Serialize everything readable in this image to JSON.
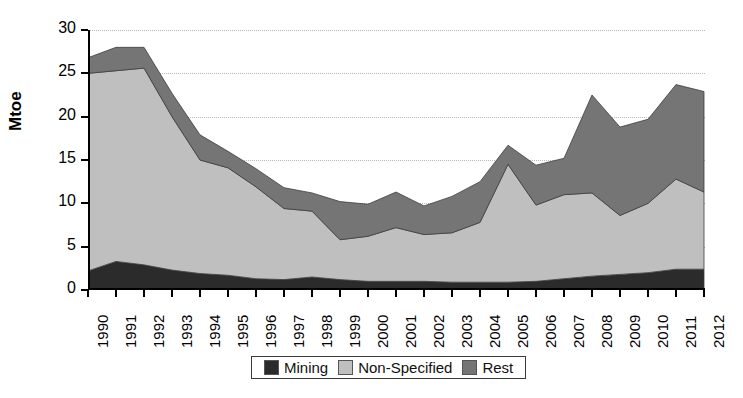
{
  "chart_data": {
    "type": "area",
    "stacked": true,
    "title": "",
    "xlabel": "",
    "ylabel": "Mtoe",
    "ylim": [
      0,
      30
    ],
    "yticks": [
      0,
      5,
      10,
      15,
      20,
      25,
      30
    ],
    "grid": true,
    "legend_position": "bottom",
    "categories": [
      "1990",
      "1991",
      "1992",
      "1993",
      "1994",
      "1995",
      "1996",
      "1997",
      "1998",
      "1999",
      "2000",
      "2001",
      "2002",
      "2003",
      "2004",
      "2005",
      "2006",
      "2007",
      "2008",
      "2009",
      "2010",
      "2011",
      "2012"
    ],
    "series": [
      {
        "name": "Mining",
        "color": "#2b2b2b",
        "values": [
          2.2,
          3.3,
          2.9,
          2.3,
          1.9,
          1.7,
          1.3,
          1.2,
          1.5,
          1.2,
          1.0,
          1.0,
          1.0,
          0.9,
          0.9,
          0.9,
          1.0,
          1.3,
          1.6,
          1.8,
          2.0,
          2.4,
          2.4
        ]
      },
      {
        "name": "Non-Specified",
        "color": "#bfbfbf",
        "values": [
          22.8,
          22.0,
          22.7,
          17.7,
          13.1,
          12.4,
          10.6,
          8.2,
          7.6,
          4.6,
          5.2,
          6.2,
          5.4,
          5.7,
          6.9,
          13.6,
          8.8,
          9.7,
          9.6,
          6.8,
          8.0,
          10.4,
          8.9
        ]
      },
      {
        "name": "Rest",
        "color": "#757575",
        "values": [
          1.8,
          2.7,
          2.4,
          2.7,
          2.9,
          1.9,
          2.1,
          2.4,
          2.1,
          4.4,
          3.7,
          4.1,
          3.3,
          4.2,
          4.7,
          2.2,
          4.6,
          4.2,
          11.3,
          10.2,
          9.7,
          10.9,
          11.6
        ]
      }
    ],
    "totals": [
      26.8,
      28.0,
      28.0,
      22.7,
      17.9,
      16.0,
      14.0,
      11.8,
      11.2,
      10.2,
      9.9,
      11.3,
      9.7,
      10.8,
      12.5,
      16.7,
      14.4,
      15.2,
      22.5,
      18.8,
      19.7,
      23.7,
      22.9
    ]
  },
  "legend": {
    "items": [
      {
        "label": "Mining",
        "color": "#2b2b2b"
      },
      {
        "label": "Non-Specified",
        "color": "#bfbfbf"
      },
      {
        "label": "Rest",
        "color": "#757575"
      }
    ]
  }
}
